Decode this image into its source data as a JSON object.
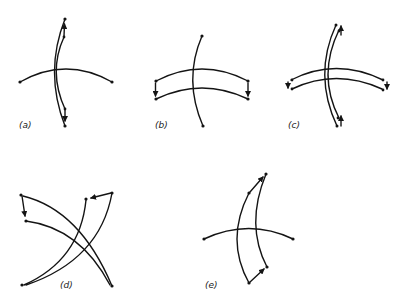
{
  "figure": {
    "panels": [
      {
        "id": "a",
        "label": "(a)"
      },
      {
        "id": "b",
        "label": "(b)"
      },
      {
        "id": "c",
        "label": "(c)"
      },
      {
        "id": "d",
        "label": "(d)"
      },
      {
        "id": "e",
        "label": "(e)"
      }
    ],
    "colors": {
      "stroke": "#141414",
      "background": "#ffffff"
    }
  }
}
